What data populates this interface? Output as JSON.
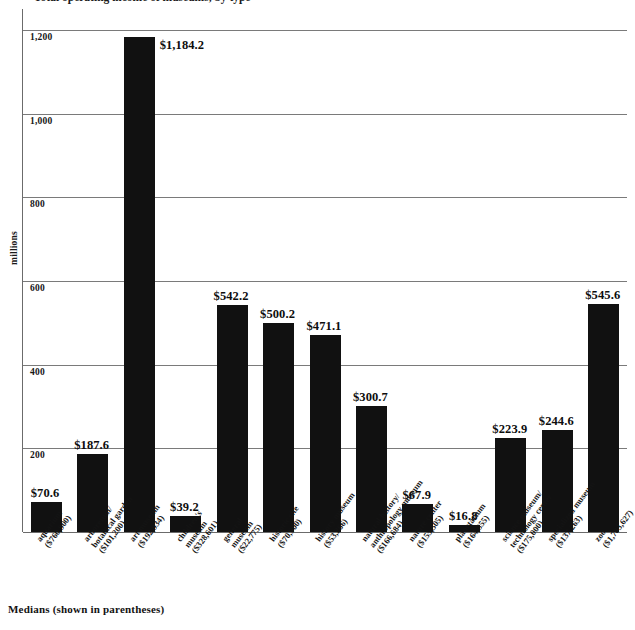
{
  "title_clipped": "Total operating income of museums, by type",
  "caption": "Medians (shown in parentheses)",
  "y_axis": {
    "label": "millions",
    "ticks": [
      "200",
      "400",
      "600",
      "800",
      "1,000",
      "1,200"
    ]
  },
  "chart_data": {
    "type": "bar",
    "title": "Total operating income of museums, by type",
    "xlabel": "",
    "ylabel": "millions",
    "ylim": [
      0,
      1250
    ],
    "grid": true,
    "legend": "none",
    "yticks": [
      200,
      400,
      600,
      800,
      1000,
      1200
    ],
    "ytick_labels": [
      "200",
      "400",
      "600",
      "800",
      "1,000",
      "1,200"
    ],
    "categories": [
      "aquarium",
      "arboretum/\nbotanical garden",
      "art museum",
      "children's\nmuseum",
      "general\nmuseum",
      "historic site",
      "history museum",
      "natural history/\nanthropology museum",
      "nature center",
      "planetarium",
      "science museum/\ntechnology center",
      "specialized museum",
      "zoo"
    ],
    "medians": [
      "($760,900)",
      "($101,200)",
      "($192,934)",
      "($328,601)",
      "($22,775)",
      "($70,900)",
      "($53,266)",
      "($166,684)",
      "($155,505)",
      "($164,355)",
      "($175,000)",
      "($137,263)",
      "($1,703,627)"
    ],
    "values": [
      70.6,
      187.6,
      1184.2,
      39.2,
      542.2,
      500.2,
      471.1,
      300.7,
      67.9,
      16.8,
      223.9,
      244.6,
      545.6
    ],
    "value_labels": [
      "$70.6",
      "$187.6",
      "$1,184.2",
      "$39.2",
      "$542.2",
      "$500.2",
      "$471.1",
      "$300.7",
      "$67.9",
      "$16.8",
      "$223.9",
      "$244.6",
      "$545.6"
    ],
    "bar_color": "#111111"
  },
  "bars": [
    {
      "cat_line1": "aquarium",
      "cat_line2": "($760,900)",
      "value_label": "$70.6"
    },
    {
      "cat_line1": "arboretum/",
      "cat_line2": "botanical garden",
      "cat_line3": "($101,200)",
      "value_label": "$187.6"
    },
    {
      "cat_line1": "art museum",
      "cat_line2": "($192,934)",
      "value_label": "$1,184.2"
    },
    {
      "cat_line1": "children's",
      "cat_line2": "museum",
      "cat_line3": "($328,601)",
      "value_label": "$39.2"
    },
    {
      "cat_line1": "general",
      "cat_line2": "museum",
      "cat_line3": "($22,775)",
      "value_label": "$542.2"
    },
    {
      "cat_line1": "historic site",
      "cat_line2": "($70,900)",
      "value_label": "$500.2"
    },
    {
      "cat_line1": "history museum",
      "cat_line2": "($53,266)",
      "value_label": "$471.1"
    },
    {
      "cat_line1": "natural history/",
      "cat_line2": "anthropology museum",
      "cat_line3": "($166,684)",
      "value_label": "$300.7"
    },
    {
      "cat_line1": "nature center",
      "cat_line2": "($155,505)",
      "value_label": "$67.9"
    },
    {
      "cat_line1": "planetarium",
      "cat_line2": "($164,355)",
      "value_label": "$16.8"
    },
    {
      "cat_line1": "science museum/",
      "cat_line2": "technology center",
      "cat_line3": "($175,000)",
      "value_label": "$223.9"
    },
    {
      "cat_line1": "specialized museum",
      "cat_line2": "($137,263)",
      "value_label": "$244.6"
    },
    {
      "cat_line1": "zoo",
      "cat_line2": "($1,703,627)",
      "value_label": "$545.6"
    }
  ]
}
